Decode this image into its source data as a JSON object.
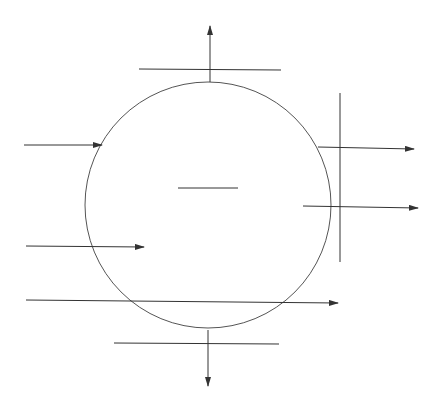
{
  "diagram": {
    "stroke_color": "#333333",
    "circle_color": "#555555",
    "circle": {
      "cx": 208,
      "cy": 205,
      "r": 123
    },
    "center_line": {
      "x1": 178,
      "y1": 188,
      "x2": 238,
      "y2": 188
    },
    "lines": [
      {
        "name": "top-tangent-line",
        "x1": 139,
        "y1": 69,
        "x2": 281,
        "y2": 70
      },
      {
        "name": "bottom-tangent-line",
        "x1": 114,
        "y1": 343,
        "x2": 279,
        "y2": 344
      },
      {
        "name": "right-tangent-line",
        "x1": 340,
        "y1": 93,
        "x2": 340,
        "y2": 262
      }
    ],
    "arrows": [
      {
        "name": "arrow-up",
        "x1": 210,
        "y1": 82,
        "x2": 210,
        "y2": 26
      },
      {
        "name": "arrow-down",
        "x1": 208,
        "y1": 330,
        "x2": 208,
        "y2": 386
      },
      {
        "name": "arrow-left-top-incoming",
        "x1": 24,
        "y1": 145,
        "x2": 102,
        "y2": 145
      },
      {
        "name": "arrow-left-mid-incoming",
        "x1": 26,
        "y1": 246,
        "x2": 144,
        "y2": 247
      },
      {
        "name": "arrow-bottom-through",
        "x1": 26,
        "y1": 300,
        "x2": 338,
        "y2": 303
      },
      {
        "name": "arrow-right-top-outgoing",
        "x1": 318,
        "y1": 147,
        "x2": 414,
        "y2": 149
      },
      {
        "name": "arrow-right-mid-outgoing",
        "x1": 303,
        "y1": 206,
        "x2": 418,
        "y2": 208
      }
    ]
  }
}
